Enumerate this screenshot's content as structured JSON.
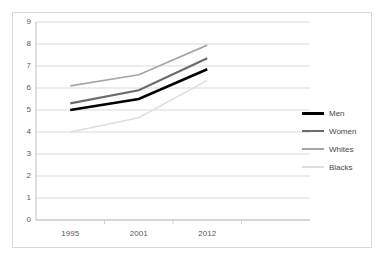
{
  "top_sliver_text": "",
  "chart_data": {
    "type": "line",
    "title": "",
    "subtitle": "",
    "xlabel": "",
    "ylabel": "",
    "categories": [
      "1995",
      "2001",
      "2012"
    ],
    "category_slots": 4,
    "ylim": [
      0,
      9
    ],
    "ytick_step": 1,
    "yticks": [
      "9",
      "8",
      "7",
      "6",
      "5",
      "4",
      "3",
      "2",
      "1",
      "0"
    ],
    "grid": true,
    "grid_axis": "y",
    "legend_position": "right",
    "series": [
      {
        "name": "Men",
        "values": [
          5.0,
          5.5,
          6.85
        ],
        "color": "#000000",
        "width": 2.6
      },
      {
        "name": "Women",
        "values": [
          5.3,
          5.9,
          7.35
        ],
        "color": "#6b6b6b",
        "width": 2.1
      },
      {
        "name": "Whites",
        "values": [
          6.1,
          6.6,
          7.95
        ],
        "color": "#a6a6a6",
        "width": 1.7
      },
      {
        "name": "Blacks",
        "values": [
          4.0,
          4.65,
          6.35
        ],
        "color": "#dedede",
        "width": 1.5
      }
    ],
    "colors": {
      "gridline": "#d0d0d0",
      "axis": "#bfbfbf",
      "tick_text": "#595959",
      "legend_text": "#494949",
      "frame_border": "#d9d9d9",
      "background": "#ffffff"
    }
  }
}
